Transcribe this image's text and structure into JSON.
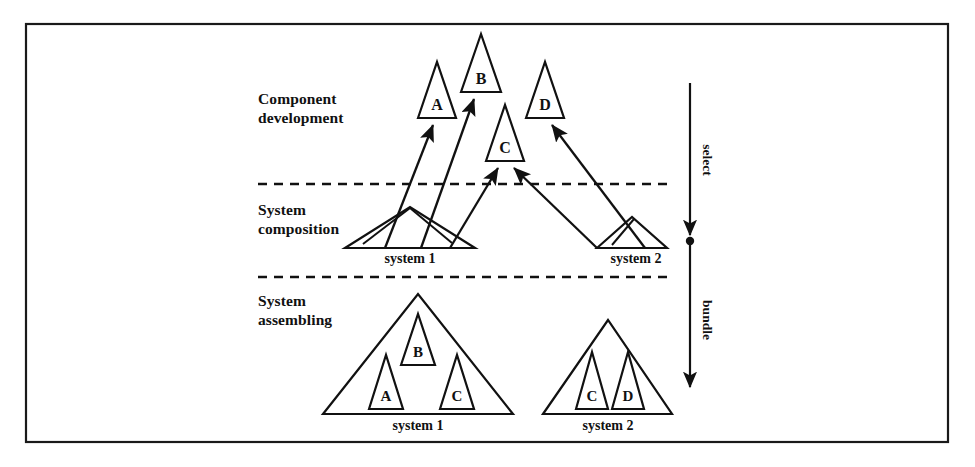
{
  "figure": {
    "background_color": "#ffffff",
    "line_color": "#111111",
    "border_color": "#1a1a1a"
  },
  "stages": [
    {
      "id": "component-development",
      "line1": "Component",
      "line2": "development",
      "label_x": 258,
      "label_y": 104
    },
    {
      "id": "system-composition",
      "line1": "System",
      "line2": "composition",
      "label_x": 258,
      "label_y": 215
    },
    {
      "id": "system-assembling",
      "line1": "System",
      "line2": "assembling",
      "label_x": 258,
      "label_y": 306
    }
  ],
  "dividers": [
    {
      "id": "divider-upper",
      "x1": 258,
      "y1": 184,
      "x2": 672,
      "y2": 184
    },
    {
      "id": "divider-lower",
      "x1": 258,
      "y1": 277,
      "x2": 672,
      "y2": 277
    }
  ],
  "components": [
    {
      "id": "component-a",
      "letter": "A",
      "apex_x": 437,
      "apex_y": 62,
      "base_y": 118,
      "half_width": 19,
      "letter_y": 110
    },
    {
      "id": "component-b",
      "letter": "B",
      "apex_x": 481,
      "apex_y": 34,
      "base_y": 92,
      "half_width": 20,
      "letter_y": 84
    },
    {
      "id": "component-c",
      "letter": "C",
      "apex_x": 505,
      "apex_y": 105,
      "base_y": 161,
      "half_width": 19,
      "letter_y": 153
    },
    {
      "id": "component-d",
      "letter": "D",
      "apex_x": 545,
      "apex_y": 62,
      "base_y": 118,
      "half_width": 19,
      "letter_y": 110
    }
  ],
  "composition_systems": [
    {
      "id": "composition-system-1",
      "label": "system 1",
      "apex_x": 410,
      "apex_y": 207,
      "base_left_x": 345,
      "base_right_x": 475,
      "base_y": 248,
      "label_x": 410,
      "label_y": 263
    },
    {
      "id": "composition-system-2",
      "label": "system 2",
      "apex_x": 632,
      "apex_y": 217,
      "base_left_x": 597,
      "base_right_x": 667,
      "base_y": 248,
      "label_x": 636,
      "label_y": 263
    }
  ],
  "assembled_systems": [
    {
      "id": "assembled-system-1",
      "label": "system 1",
      "apex_x": 418,
      "apex_y": 294,
      "base_left_x": 323,
      "base_right_x": 513,
      "base_y": 414,
      "label_x": 418,
      "label_y": 430,
      "children": [
        {
          "id": "assembled-s1-b",
          "letter": "B",
          "apex_x": 418,
          "apex_y": 314,
          "base_y": 365,
          "half_width": 17,
          "letter_y": 357
        },
        {
          "id": "assembled-s1-a",
          "letter": "A",
          "apex_x": 386,
          "apex_y": 355,
          "base_y": 409,
          "half_width": 17,
          "letter_y": 401
        },
        {
          "id": "assembled-s1-c",
          "letter": "C",
          "apex_x": 457,
          "apex_y": 355,
          "base_y": 409,
          "half_width": 17,
          "letter_y": 401
        }
      ]
    },
    {
      "id": "assembled-system-2",
      "label": "system 2",
      "apex_x": 608,
      "apex_y": 320,
      "base_left_x": 543,
      "base_right_x": 672,
      "base_y": 414,
      "label_x": 608,
      "label_y": 430,
      "children": [
        {
          "id": "assembled-s2-c",
          "letter": "C",
          "apex_x": 592,
          "apex_y": 352,
          "base_y": 409,
          "half_width": 16,
          "letter_y": 401
        },
        {
          "id": "assembled-s2-d",
          "letter": "D",
          "apex_x": 628,
          "apex_y": 352,
          "base_y": 409,
          "half_width": 16,
          "letter_y": 401
        }
      ]
    }
  ],
  "select_arrows": [
    {
      "id": "arrow-system1-to-a",
      "x1": 385,
      "y1": 248,
      "x2": 433,
      "y2": 125
    },
    {
      "id": "arrow-system1-to-b",
      "x1": 421,
      "y1": 248,
      "x2": 474,
      "y2": 99
    },
    {
      "id": "arrow-system1-to-c",
      "x1": 450,
      "y1": 248,
      "x2": 498,
      "y2": 168
    },
    {
      "id": "arrow-system2-to-c",
      "x1": 597,
      "y1": 248,
      "x2": 514,
      "y2": 168
    },
    {
      "id": "arrow-system2-to-d",
      "x1": 645,
      "y1": 248,
      "x2": 552,
      "y2": 125
    }
  ],
  "composition_inner_strokes": [
    {
      "id": "comp-s1-ridge-left",
      "x1": 363,
      "y1": 244,
      "x2": 410,
      "y2": 208
    },
    {
      "id": "comp-s1-ridge-right",
      "x1": 410,
      "y1": 208,
      "x2": 452,
      "y2": 243
    },
    {
      "id": "comp-s2-ridge",
      "x1": 612,
      "y1": 245,
      "x2": 634,
      "y2": 219
    }
  ],
  "axis": {
    "id": "process-axis",
    "x": 690,
    "top_y": 83,
    "mid_y": 241,
    "bottom_y": 387,
    "upper_label": "select",
    "lower_label": "bundle",
    "upper_label_y": 160,
    "lower_label_y": 320,
    "label_offset_x": 13
  },
  "frame": {
    "id": "figure-frame",
    "x": 26,
    "y": 24,
    "width": 922,
    "height": 418
  }
}
